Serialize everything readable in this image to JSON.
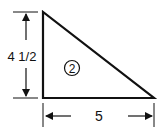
{
  "figure": {
    "shape": "right-triangle",
    "region_label": "2",
    "dimensions": {
      "height": {
        "label": "4 1/2"
      },
      "base": {
        "label": "5"
      }
    },
    "colors": {
      "stroke": "#111111",
      "background": "#ffffff"
    }
  }
}
